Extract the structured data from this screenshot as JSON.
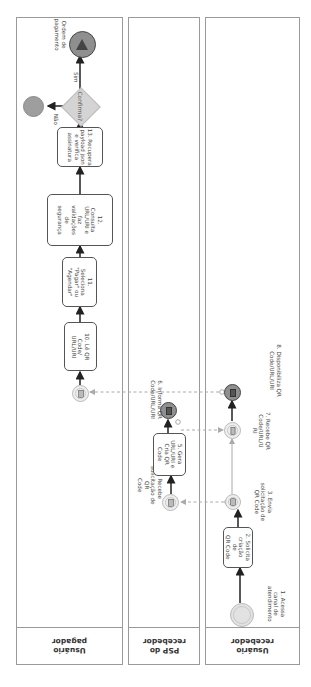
{
  "lanes": [
    {
      "id": "pagador",
      "label": "Usuário\npagador"
    },
    {
      "id": "psp",
      "label": "PSP do\nrecebedor"
    },
    {
      "id": "recebedor",
      "label": "Usuário\nrecebedor"
    }
  ],
  "nodes": {
    "n1": {
      "type": "start-event",
      "label": "1. Acessa\ncanal de\natendimento"
    },
    "n2": {
      "type": "task",
      "label": "2. Solicita\ncriação de\nQR Code"
    },
    "n3": {
      "type": "message-throw-event",
      "label": "3. Envia\nsolicitação de\nQR Code"
    },
    "n4": {
      "type": "message-catch-event",
      "label": "4. Recebe\nsolicitação de QR\nCode"
    },
    "n5": {
      "type": "task",
      "label": "5. Gera\nURL/URI e\nCria QR\nCode"
    },
    "n6": {
      "type": "message-end-event",
      "label": "6. Informa QR\nCode/URL/URI"
    },
    "n7": {
      "type": "message-catch-event",
      "label": "7. Recebe QR\nCode/URL/U\nRI"
    },
    "n8": {
      "type": "message-end-event",
      "label": "8. Disponibiliza QR\nCode/URL/URI"
    },
    "n9": {
      "type": "message-catch-event",
      "label": ""
    },
    "n10": {
      "type": "task",
      "label": "10. Lê QR\nCode/\nURL/URI"
    },
    "n11": {
      "type": "task",
      "label": "11. Seleciona\n\"Pagar\" ou\n\"Agendar\""
    },
    "n12": {
      "type": "task",
      "label": "12.\nConsulta\nURL/URI e\nfaz\nvalidações\nde\nsegurança"
    },
    "n13": {
      "type": "task",
      "label": "13. Recupera\npayload json\ne verifica\nassinatura"
    },
    "gateway": {
      "type": "exclusive-gateway",
      "label": "Confirma?"
    },
    "end_no": {
      "type": "end-event",
      "label": ""
    },
    "end_yes": {
      "type": "end-event",
      "label": "Ordem de\npagamento"
    }
  },
  "edge_labels": {
    "no": "Não",
    "yes": "Sim"
  },
  "colors": {
    "lane_border": "#9a9a9a",
    "sequence_flow": "#333333",
    "message_flow": "#a8a8a8",
    "gateway_fill": "#d4d4d4",
    "end_event_fill": "#8f8f8f"
  }
}
